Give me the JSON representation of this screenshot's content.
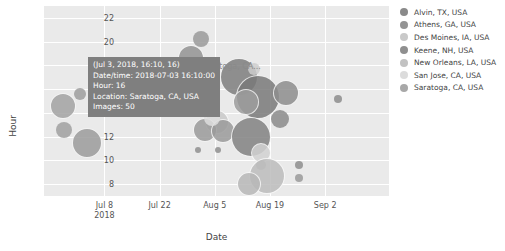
{
  "chart_data": {
    "type": "scatter",
    "title": "",
    "xlabel": "Date",
    "ylabel": "Hour",
    "grid": true,
    "legend_position": "right",
    "xticks": [
      {
        "label": "Jul 8",
        "sublabel": "2018",
        "pos": 0.175
      },
      {
        "label": "Jul 22",
        "sublabel": "",
        "pos": 0.335
      },
      {
        "label": "Aug 5",
        "sublabel": "",
        "pos": 0.495
      },
      {
        "label": "Aug 19",
        "sublabel": "",
        "pos": 0.655
      },
      {
        "label": "Sep 2",
        "sublabel": "",
        "pos": 0.815
      }
    ],
    "yticks": [
      22,
      20,
      18,
      16,
      14,
      12,
      10,
      8
    ],
    "ylim": [
      7,
      23
    ],
    "series": [
      {
        "name": "Alvin, TX, USA",
        "color": "#8a8a8a"
      },
      {
        "name": "Athens, GA, USA",
        "color": "#949494"
      },
      {
        "name": "Des Moines, IA, USA",
        "color": "#c9c9c9"
      },
      {
        "name": "Keene, NH, USA",
        "color": "#8f8f8f"
      },
      {
        "name": "New Orleans, LA, USA",
        "color": "#c2c2c2"
      },
      {
        "name": "San Jose, CA, USA",
        "color": "#dcdcdc"
      },
      {
        "name": "Saratoga, CA, USA",
        "color": "#a8a8a8"
      }
    ],
    "points": [
      {
        "x": 0.055,
        "y": 14.6,
        "r": 13,
        "color": "#a3a3a3",
        "series": "Saratoga, CA, USA"
      },
      {
        "x": 0.103,
        "y": 15.6,
        "r": 6,
        "color": "#9e9e9e",
        "series": "Saratoga, CA, USA"
      },
      {
        "x": 0.058,
        "y": 12.6,
        "r": 8,
        "color": "#a0a0a0",
        "series": "Saratoga, CA, USA"
      },
      {
        "x": 0.125,
        "y": 11.5,
        "r": 15,
        "color": "#9c9c9c",
        "series": "Saratoga, CA, USA"
      },
      {
        "x": 0.455,
        "y": 20.2,
        "r": 8,
        "color": "#9a9a9a",
        "series": "Keene, NH, USA"
      },
      {
        "x": 0.425,
        "y": 18.6,
        "r": 13,
        "color": "#949494",
        "series": "Keene, NH, USA"
      },
      {
        "x": 0.565,
        "y": 17.0,
        "r": 19,
        "color": "#7e7e7e",
        "series": "Athens, GA, USA"
      },
      {
        "x": 0.61,
        "y": 17.7,
        "r": 6,
        "color": "#cccccc",
        "series": "Des Moines, IA, USA"
      },
      {
        "x": 0.62,
        "y": 15.3,
        "r": 22,
        "color": "#7a7a7a",
        "series": "Alvin, TX, USA"
      },
      {
        "x": 0.585,
        "y": 14.9,
        "r": 13,
        "color": "#9d9d9d",
        "series": "Saratoga, CA, USA"
      },
      {
        "x": 0.7,
        "y": 15.7,
        "r": 13,
        "color": "#8e8e8e",
        "series": "Keene, NH, USA"
      },
      {
        "x": 0.683,
        "y": 13.5,
        "r": 9,
        "color": "#8b8b8b",
        "series": "Athens, GA, USA"
      },
      {
        "x": 0.5,
        "y": 13.2,
        "r": 12,
        "color": "#cacaca",
        "series": "New Orleans, LA, USA"
      },
      {
        "x": 0.468,
        "y": 12.6,
        "r": 12,
        "color": "#9b9b9b",
        "series": "Saratoga, CA, USA"
      },
      {
        "x": 0.52,
        "y": 12.5,
        "r": 12,
        "color": "#9b9b9b",
        "series": "Saratoga, CA, USA"
      },
      {
        "x": 0.487,
        "y": 13.6,
        "r": 8,
        "color": "#dedede",
        "series": "San Jose, CA, USA"
      },
      {
        "x": 0.6,
        "y": 12.0,
        "r": 20,
        "color": "#828282",
        "series": "Alvin, TX, USA"
      },
      {
        "x": 0.63,
        "y": 10.6,
        "r": 10,
        "color": "#d2d2d2",
        "series": "New Orleans, LA, USA"
      },
      {
        "x": 0.628,
        "y": 9.6,
        "r": 5,
        "color": "#b6b6b6",
        "series": "Saratoga, CA, USA"
      },
      {
        "x": 0.645,
        "y": 8.7,
        "r": 18,
        "color": "#bdbdbd",
        "series": "New Orleans, LA, USA"
      },
      {
        "x": 0.595,
        "y": 8.0,
        "r": 12,
        "color": "#b8b8b8",
        "series": "New Orleans, LA, USA"
      },
      {
        "x": 0.738,
        "y": 9.6,
        "r": 4,
        "color": "#8e8e8e",
        "series": "Athens, GA, USA"
      },
      {
        "x": 0.738,
        "y": 8.5,
        "r": 4,
        "color": "#9a9a9a",
        "series": "Athens, GA, USA"
      },
      {
        "x": 0.852,
        "y": 15.2,
        "r": 4,
        "color": "#8d8d8d",
        "series": "Athens, GA, USA"
      },
      {
        "x": 0.447,
        "y": 10.9,
        "r": 3,
        "color": "#8f8f8f",
        "series": "Athens, GA, USA"
      },
      {
        "x": 0.505,
        "y": 10.9,
        "r": 3,
        "color": "#8f8f8f",
        "series": "Athens, GA, USA"
      }
    ],
    "annotations": [
      {
        "text": "Saratoga, CA...",
        "x": 0.455,
        "y": 17.9
      }
    ]
  },
  "tooltip": {
    "header": "(Jul 3, 2018, 16:10, 16)",
    "datetime": "Date/time: 2018-07-03 16:10:00",
    "hour": "Hour: 16",
    "location": "Location: Saratoga, CA, USA",
    "images": "Images: 50"
  },
  "colors": {
    "plot_background": "#eaeaea",
    "grid": "#ffffff",
    "tooltip_background": "#7f7f7f",
    "text": "#444444"
  }
}
